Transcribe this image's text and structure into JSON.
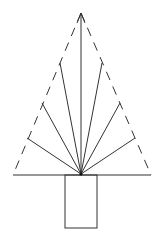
{
  "diagram": {
    "title": "",
    "colors": {
      "line": "#333333",
      "background": "#ffffff"
    },
    "apex": [
      81,
      13
    ],
    "hub": [
      81,
      174
    ],
    "base_line": {
      "x1": 13,
      "y1": 175,
      "x2": 151,
      "y2": 175
    },
    "rays_end_points": [
      [
        81,
        13
      ],
      [
        60,
        63
      ],
      [
        102,
        63
      ],
      [
        42,
        103
      ],
      [
        120,
        103
      ],
      [
        27,
        138
      ],
      [
        135,
        138
      ]
    ],
    "trunk": {
      "x": 65,
      "y": 175,
      "width": 32,
      "height": 53
    }
  }
}
